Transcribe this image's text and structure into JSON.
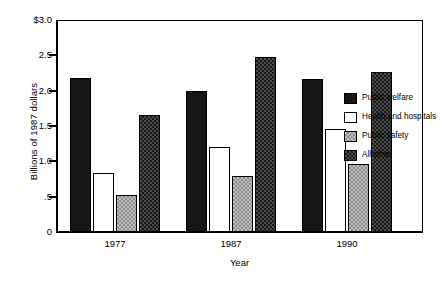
{
  "chart_data": {
    "type": "bar",
    "title": "",
    "xlabel": "Year",
    "ylabel": "Billions of 1987 dollars",
    "categories": [
      "1977",
      "1987",
      "1990"
    ],
    "series": [
      {
        "name": "Public welfare",
        "key": "public-welfare",
        "swatch": "black",
        "color": "#161616",
        "values": [
          2.18,
          2.0,
          2.17
        ]
      },
      {
        "name": "Health and hospitals",
        "key": "health-and-hospitals",
        "swatch": "white",
        "color": "#ffffff",
        "values": [
          0.83,
          1.2,
          1.46
        ]
      },
      {
        "name": "Public safety",
        "key": "public-safety",
        "swatch": "light-checker",
        "color": "#bdbdbd",
        "values": [
          0.53,
          0.79,
          0.96
        ]
      },
      {
        "name": "All other",
        "key": "all-other",
        "swatch": "dark-checker",
        "color": "#4a4a4a",
        "values": [
          1.65,
          2.48,
          2.27
        ]
      }
    ],
    "ylim": [
      0,
      3.0
    ],
    "ytick_values": [
      0,
      0.5,
      1.0,
      1.5,
      2.0,
      2.5,
      3.0
    ],
    "ytick_labels": [
      "0",
      ".5",
      "1.0",
      "1.5",
      "2.0",
      "2.5",
      "$3.0"
    ],
    "grid": false,
    "legend_position": "inside-right"
  },
  "axes": {
    "y_title": "Billions of 1987 dollars",
    "x_title": "Year",
    "y_ticks": [
      {
        "label": "$3.0",
        "value": 3.0
      },
      {
        "label": "2.5",
        "value": 2.5
      },
      {
        "label": "2.0",
        "value": 2.0
      },
      {
        "label": "1.5",
        "value": 1.5
      },
      {
        "label": "1.0",
        "value": 1.0
      },
      {
        "label": ".5",
        "value": 0.5
      },
      {
        "label": "0",
        "value": 0.0
      }
    ],
    "x_ticks": [
      {
        "label": "1977"
      },
      {
        "label": "1987"
      },
      {
        "label": "1990"
      }
    ]
  },
  "legend": {
    "items": [
      {
        "label": "Public welfare"
      },
      {
        "label": "Health and hospitals"
      },
      {
        "label": "Public safety"
      },
      {
        "label": "All other"
      }
    ]
  }
}
